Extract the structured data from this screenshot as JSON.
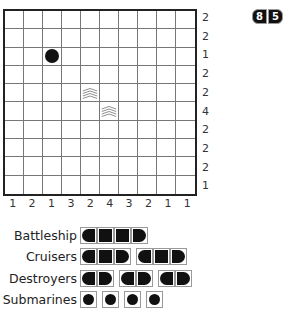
{
  "puzzle": {
    "size": 10,
    "row_clues": [
      "2",
      "2",
      "1",
      "2",
      "2",
      "4",
      "2",
      "2",
      "2",
      "1"
    ],
    "col_clues": [
      "1",
      "2",
      "1",
      "3",
      "2",
      "4",
      "3",
      "2",
      "1",
      "1"
    ],
    "given_cells": [
      {
        "row": 2,
        "col": 2,
        "type": "submarine"
      },
      {
        "row": 4,
        "col": 4,
        "type": "water"
      },
      {
        "row": 5,
        "col": 5,
        "type": "water"
      }
    ]
  },
  "counter": {
    "digits": [
      "8",
      "5"
    ]
  },
  "fleet": [
    {
      "label": "Battleship",
      "ships": [
        4
      ]
    },
    {
      "label": "Cruisers",
      "ships": [
        3,
        3
      ]
    },
    {
      "label": "Destroyers",
      "ships": [
        2,
        2,
        2
      ]
    },
    {
      "label": "Submarines",
      "ships": [
        1,
        1,
        1,
        1
      ]
    }
  ],
  "colors": {
    "ship": "#111111",
    "grid": "#777777",
    "border": "#222222"
  }
}
